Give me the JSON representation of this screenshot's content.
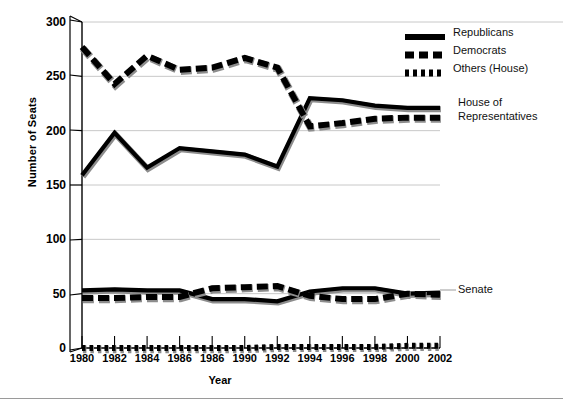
{
  "chart": {
    "type": "line",
    "ylabel": "Number of Seats",
    "xlabel": "Year"
  },
  "axes": {
    "yticks": [
      0,
      50,
      100,
      150,
      200,
      250,
      300
    ],
    "ylim": [
      0,
      300
    ],
    "xtick_labels": [
      "1980",
      "1982",
      "1984",
      "1986",
      "1986",
      "1990",
      "1992",
      "1994",
      "1996",
      "1998",
      "2000",
      "2002"
    ]
  },
  "legend": {
    "position": "top-right",
    "items": [
      {
        "label": "Republicans",
        "style": "solid",
        "color": "#000000"
      },
      {
        "label": "Democrats",
        "style": "dashed",
        "color": "#000000"
      },
      {
        "label": "Others (House)",
        "style": "dotted",
        "color": "#000000"
      }
    ]
  },
  "annotations": {
    "house": "House of Representatives",
    "house_line1": "House of",
    "house_line2": "Representatives",
    "senate": "Senate"
  },
  "chart_data": {
    "type": "line",
    "title": "",
    "xlabel": "Year",
    "ylabel": "Number of Seats",
    "ylim": [
      0,
      300
    ],
    "yticks": [
      0,
      50,
      100,
      150,
      200,
      250,
      300
    ],
    "grid": "horizontal",
    "legend_position": "top-right",
    "x": [
      1980,
      1982,
      1984,
      1986,
      1988,
      1990,
      1992,
      1994,
      1996,
      1998,
      2000,
      2002
    ],
    "x_tick_labels_as_rendered": [
      "1980",
      "1982",
      "1984",
      "1986",
      "1986",
      "1990",
      "1992",
      "1994",
      "1996",
      "1998",
      "2000",
      "2002"
    ],
    "series": [
      {
        "name": "Republicans",
        "chamber": "House of Representatives",
        "style": "solid",
        "values": [
          159,
          198,
          166,
          184,
          181,
          178,
          167,
          230,
          228,
          223,
          221,
          221
        ]
      },
      {
        "name": "Democrats",
        "chamber": "House of Representatives",
        "style": "dashed",
        "values": [
          277,
          243,
          269,
          256,
          258,
          267,
          258,
          204,
          207,
          211,
          212,
          212
        ]
      },
      {
        "name": "Others (House)",
        "chamber": "House of Representatives",
        "style": "dotted",
        "values": [
          0,
          0,
          0,
          0,
          0,
          0,
          1,
          1,
          1,
          1,
          2,
          2
        ]
      },
      {
        "name": "Republicans",
        "chamber": "Senate",
        "style": "solid",
        "values": [
          53,
          54,
          53,
          53,
          45,
          45,
          43,
          52,
          55,
          55,
          50,
          51
        ]
      },
      {
        "name": "Democrats",
        "chamber": "Senate",
        "style": "dashed",
        "values": [
          46,
          46,
          47,
          47,
          55,
          56,
          57,
          48,
          45,
          45,
          50,
          49
        ]
      }
    ]
  }
}
